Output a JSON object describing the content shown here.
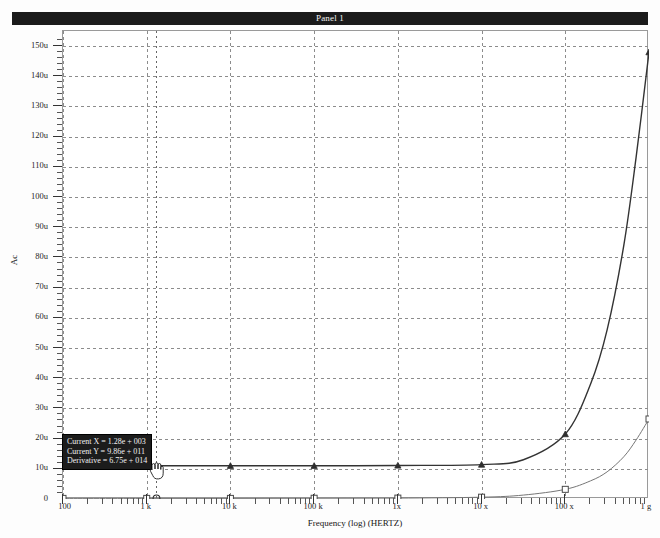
{
  "window": {
    "title": "Panel 1"
  },
  "tooltip": {
    "lines": [
      "Current X = 1.28e + 003",
      "Current Y = 9.86e + 011",
      "Derivative = 6.75e + 014"
    ],
    "background": "#1c1c1c",
    "text_color": "#f0f0f0"
  },
  "cursor": {
    "icon": "hand-pointer-cursor"
  },
  "chart_data": {
    "type": "line",
    "title": "Panel 1",
    "xlabel": "Frequency (log) (HERTZ)",
    "ylabel": "Ac",
    "xscale": "log",
    "xlim": [
      100,
      1000000000
    ],
    "ylim": [
      0,
      155
    ],
    "grid": true,
    "legend": "none",
    "gridcolor": "#8c8c8c",
    "y_tick_labels": [
      "150u",
      "140u",
      "130u",
      "120u",
      "110u",
      "100u",
      "90u",
      "80u",
      "70u",
      "60u",
      "50u",
      "40u",
      "30u",
      "20u",
      "10u",
      "0"
    ],
    "y_tick_values": [
      150,
      140,
      130,
      120,
      110,
      100,
      90,
      80,
      70,
      60,
      50,
      40,
      30,
      20,
      10,
      0
    ],
    "x_tick_labels": [
      "100",
      "1 k",
      "10 k",
      "100 k",
      "1x",
      "10 x",
      "100 x",
      "1 g"
    ],
    "x_tick_values": [
      100,
      1000,
      10000,
      100000,
      1000000,
      10000000,
      100000000,
      1000000000
    ],
    "series": [
      {
        "name": "trace-1",
        "color": "#333333",
        "marker": "triangle",
        "width": 1.4,
        "x": [
          100,
          1000,
          10000,
          100000,
          1000000,
          10000000,
          31600000,
          100000000,
          200000000,
          316000000,
          500000000,
          700000000,
          1000000000
        ],
        "y": [
          11.0,
          11.0,
          11.0,
          11.0,
          11.1,
          11.4,
          13.0,
          21.5,
          38.0,
          56.0,
          84.0,
          113.0,
          148.0
        ]
      },
      {
        "name": "trace-2",
        "color": "#767676",
        "marker": "square",
        "width": 1.0,
        "x": [
          100,
          1000,
          10000,
          100000,
          1000000,
          10000000,
          31600000,
          100000000,
          200000000,
          316000000,
          500000000,
          700000000,
          1000000000
        ],
        "y": [
          0.2,
          0.2,
          0.2,
          0.25,
          0.3,
          0.6,
          1.3,
          3.2,
          6.0,
          9.0,
          14.0,
          19.5,
          26.5
        ]
      }
    ],
    "marker_x": [
      100,
      1000,
      10000,
      100000,
      1000000,
      10000000,
      100000000,
      1000000000
    ],
    "cursor_marker": {
      "x": 1280,
      "series": "trace-2"
    }
  }
}
